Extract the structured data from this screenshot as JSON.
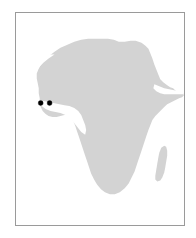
{
  "figure": {
    "kind": "locator-map",
    "width_px": 196,
    "height_px": 238,
    "background_color": "#ffffff",
    "title": "",
    "caption": ""
  },
  "frame": {
    "border_color": "#9a9a9a",
    "border_width_px": 1,
    "fill_color": "#ffffff",
    "left_px": 15,
    "top_px": 12,
    "width_px": 170,
    "height_px": 214
  },
  "map": {
    "region_label": "Africa",
    "landmass_color": "#d3d3d3",
    "landmass_stroke": "none",
    "ocean_color": "#ffffff",
    "features": [
      {
        "name": "africa-mainland",
        "type": "landmass",
        "fill": "#d3d3d3"
      },
      {
        "name": "madagascar",
        "type": "island",
        "fill": "#d3d3d3"
      }
    ]
  },
  "chart_data": {
    "type": "scatter",
    "title": "",
    "subtitle": "",
    "xlabel": "",
    "ylabel": "",
    "grid": false,
    "legend_position": "none",
    "basemap": "Africa",
    "marker": {
      "shape": "circle",
      "color": "#000000",
      "radius_px": 2.5,
      "edge_color": "#000000"
    },
    "points": [
      {
        "name": "site-1",
        "label": "",
        "x_px": 40,
        "y_px": 103,
        "x_frac": 0.147,
        "y_frac": 0.425
      },
      {
        "name": "site-2",
        "label": "",
        "x_px": 49,
        "y_px": 103,
        "x_frac": 0.2,
        "y_frac": 0.425
      }
    ],
    "point_count": 2,
    "annotations": []
  },
  "accessibility": {
    "alt_text": "Outline map of Africa shaded light gray with two black dots marking locations in West Africa."
  }
}
